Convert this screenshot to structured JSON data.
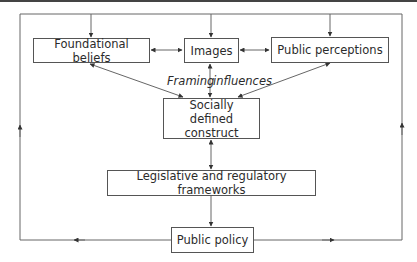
{
  "diagram": {
    "nodes": {
      "foundational_beliefs": "Foundational beliefs",
      "images": "Images",
      "public_perceptions": "Public perceptions",
      "socially_defined_construct": "Socially defined construct",
      "legislative_frameworks": "Legislative and regulatory frameworks",
      "public_policy": "Public policy"
    },
    "annotations": {
      "framing_influences_left": "Framing",
      "framing_influences_right": "influences"
    },
    "edges": [
      {
        "from": "Public policy",
        "to": "Foundational beliefs",
        "type": "feedback-loop"
      },
      {
        "from": "Public policy",
        "to": "Images",
        "type": "feedback-loop"
      },
      {
        "from": "Public policy",
        "to": "Public perceptions",
        "type": "feedback-loop"
      },
      {
        "from": "Foundational beliefs",
        "to": "Images",
        "type": "bidirectional"
      },
      {
        "from": "Images",
        "to": "Public perceptions",
        "type": "bidirectional"
      },
      {
        "from": "Foundational beliefs",
        "to": "Socially defined construct",
        "type": "bidirectional"
      },
      {
        "from": "Images",
        "to": "Socially defined construct",
        "type": "bidirectional"
      },
      {
        "from": "Public perceptions",
        "to": "Socially defined construct",
        "type": "bidirectional"
      },
      {
        "from": "Socially defined construct",
        "to": "Legislative and regulatory frameworks",
        "type": "bidirectional"
      },
      {
        "from": "Legislative and regulatory frameworks",
        "to": "Public policy",
        "type": "directed"
      }
    ],
    "colors": {
      "line": "#555555",
      "text": "#2b2b2b",
      "background": "#ffffff"
    }
  }
}
